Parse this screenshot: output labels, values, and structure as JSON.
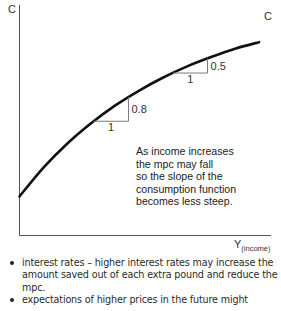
{
  "chart_data": {
    "type": "line",
    "title": "",
    "xlabel": "Y",
    "xlabel_subscript": "(income)",
    "ylabel": "C",
    "curve_label": "C",
    "series": [
      {
        "name": "Consumption function",
        "x": [
          0,
          1,
          2,
          3,
          4,
          5,
          6,
          7,
          8,
          9,
          10
        ],
        "y": [
          0,
          1.55,
          2.85,
          3.95,
          4.9,
          5.7,
          6.4,
          7.0,
          7.5,
          7.95,
          8.3
        ]
      }
    ],
    "xlim": [
      0,
      10.5
    ],
    "ylim": [
      -2.1,
      10.3
    ],
    "grid": false,
    "annotations": {
      "slope_triangles": [
        {
          "run_label": "1",
          "rise_label": "0.8",
          "at_x": 4.55
        },
        {
          "run_label": "1",
          "rise_label": "0.5",
          "at_x": 7.85
        }
      ],
      "note_lines": [
        "As income increases",
        "the mpc may fall",
        "so the slope of the",
        "consumption function",
        "becomes less steep."
      ]
    }
  },
  "bullets": [
    "interest rates – higher interest rates may increase the amount saved out of each extra pound and reduce the mpc.",
    "expectations of higher prices in the future might"
  ]
}
